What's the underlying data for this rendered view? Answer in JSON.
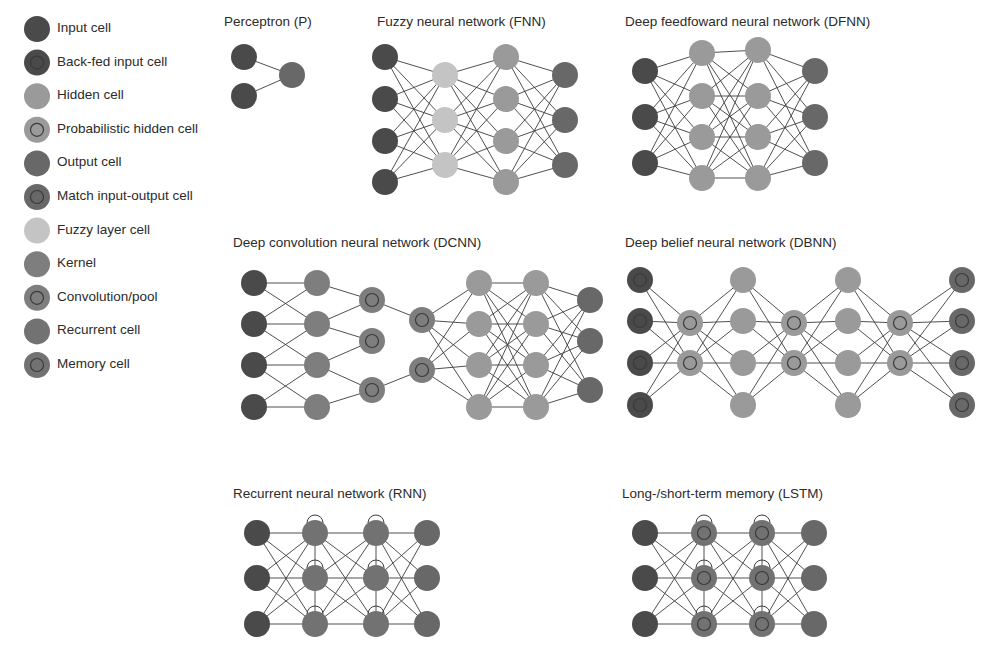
{
  "colors": {
    "input": "#4a4a4a",
    "backfed": "#4a4a4a",
    "hidden": "#9a9a9a",
    "probhidden": "#9a9a9a",
    "output": "#686868",
    "match": "#686868",
    "fuzzy": "#c4c4c4",
    "kernel": "#7e7e7e",
    "conv": "#7e7e7e",
    "recurrent": "#727272",
    "memory": "#727272",
    "ring": "#3a3a3a",
    "edge": "#3c3c3c"
  },
  "legend": [
    {
      "type": "input",
      "label": "Input cell"
    },
    {
      "type": "backfed",
      "label": "Back-fed input cell"
    },
    {
      "type": "hidden",
      "label": "Hidden cell"
    },
    {
      "type": "probhidden",
      "label": "Probabilistic hidden cell"
    },
    {
      "type": "output",
      "label": "Output cell"
    },
    {
      "type": "match",
      "label": "Match input-output cell"
    },
    {
      "type": "fuzzy",
      "label": "Fuzzy layer cell"
    },
    {
      "type": "kernel",
      "label": "Kernel"
    },
    {
      "type": "conv",
      "label": "Convolution/pool"
    },
    {
      "type": "recurrent",
      "label": "Recurrent cell"
    },
    {
      "type": "memory",
      "label": "Memory cell"
    }
  ],
  "networks": [
    {
      "id": "p",
      "title": "Perceptron (P)",
      "title_x": 224,
      "title_y": 14,
      "connect": "full",
      "layers": [
        {
          "x": 244,
          "type": "input",
          "ys": [
            57,
            96
          ]
        },
        {
          "x": 292,
          "type": "output",
          "ys": [
            75
          ]
        }
      ]
    },
    {
      "id": "fnn",
      "title": "Fuzzy neural network (FNN)",
      "title_x": 377,
      "title_y": 14,
      "connect": "full",
      "layers": [
        {
          "x": 385,
          "type": "input",
          "ys": [
            57,
            99,
            141,
            182
          ]
        },
        {
          "x": 445,
          "type": "fuzzy",
          "ys": [
            75,
            120,
            165
          ]
        },
        {
          "x": 506,
          "type": "hidden",
          "ys": [
            57,
            99,
            141,
            182
          ]
        },
        {
          "x": 565,
          "type": "output",
          "ys": [
            75,
            120,
            165
          ]
        }
      ]
    },
    {
      "id": "dfnn",
      "title": "Deep feedfoward neural network (DFNN)",
      "title_x": 625,
      "title_y": 14,
      "connect": "full",
      "layers": [
        {
          "x": 645,
          "type": "input",
          "ys": [
            71,
            117,
            163
          ]
        },
        {
          "x": 702,
          "type": "hidden",
          "ys": [
            53,
            96,
            137,
            178
          ]
        },
        {
          "x": 758,
          "type": "hidden",
          "ys": [
            50,
            96,
            137,
            178
          ]
        },
        {
          "x": 815,
          "type": "output",
          "ys": [
            71,
            117,
            163
          ]
        }
      ]
    },
    {
      "id": "dcnn",
      "title": "Deep convolution neural network (DCNN)",
      "title_x": 233,
      "title_y": 235,
      "connect": "mixed",
      "layers": [
        {
          "x": 254,
          "type": "input",
          "ys": [
            283,
            324,
            365,
            407
          ]
        },
        {
          "x": 317,
          "type": "kernel",
          "ys": [
            283,
            324,
            365,
            407
          ]
        },
        {
          "x": 372,
          "type": "conv",
          "ys": [
            300,
            341,
            390
          ]
        },
        {
          "x": 422,
          "type": "conv",
          "ys": [
            320,
            370
          ]
        },
        {
          "x": 479,
          "type": "hidden",
          "ys": [
            283,
            324,
            365,
            407
          ]
        },
        {
          "x": 536,
          "type": "hidden",
          "ys": [
            283,
            324,
            365,
            407
          ]
        },
        {
          "x": 590,
          "type": "output",
          "ys": [
            300,
            341,
            390
          ]
        }
      ],
      "links": [
        "local",
        "local",
        "local",
        "full",
        "full",
        "full"
      ]
    },
    {
      "id": "dbnn",
      "title": "Deep belief neural network (DBNN)",
      "title_x": 625,
      "title_y": 235,
      "connect": "full",
      "layers": [
        {
          "x": 640,
          "type": "backfed",
          "ys": [
            280,
            321,
            363,
            405
          ]
        },
        {
          "x": 690,
          "type": "probhidden",
          "ys": [
            323,
            363
          ]
        },
        {
          "x": 743,
          "type": "hidden",
          "ys": [
            280,
            321,
            363,
            405
          ]
        },
        {
          "x": 794,
          "type": "probhidden",
          "ys": [
            323,
            363
          ]
        },
        {
          "x": 848,
          "type": "hidden",
          "ys": [
            280,
            321,
            363,
            405
          ]
        },
        {
          "x": 900,
          "type": "probhidden",
          "ys": [
            323,
            363
          ]
        },
        {
          "x": 962,
          "type": "match",
          "ys": [
            280,
            321,
            363,
            405
          ]
        }
      ]
    },
    {
      "id": "rnn",
      "title": "Recurrent neural network (RNN)",
      "title_x": 233,
      "title_y": 486,
      "connect": "full",
      "self_loops": true,
      "layers": [
        {
          "x": 257,
          "type": "input",
          "ys": [
            533,
            578,
            624
          ]
        },
        {
          "x": 315,
          "type": "recurrent",
          "ys": [
            533,
            578,
            624
          ]
        },
        {
          "x": 376,
          "type": "recurrent",
          "ys": [
            533,
            578,
            624
          ]
        },
        {
          "x": 427,
          "type": "output",
          "ys": [
            533,
            578,
            624
          ]
        }
      ]
    },
    {
      "id": "lstm",
      "title": "Long-/short-term memory (LSTM)",
      "title_x": 622,
      "title_y": 486,
      "connect": "full",
      "self_loops": true,
      "layers": [
        {
          "x": 645,
          "type": "input",
          "ys": [
            533,
            578,
            624
          ]
        },
        {
          "x": 704,
          "type": "memory",
          "ys": [
            533,
            578,
            624
          ]
        },
        {
          "x": 762,
          "type": "memory",
          "ys": [
            533,
            578,
            624
          ]
        },
        {
          "x": 814,
          "type": "output",
          "ys": [
            533,
            578,
            624
          ]
        }
      ]
    }
  ]
}
